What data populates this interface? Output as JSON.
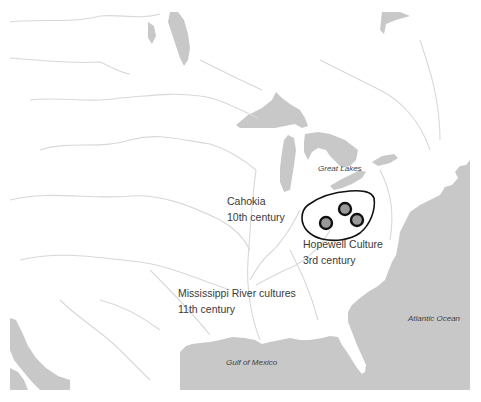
{
  "map": {
    "colors": {
      "land": "#ffffff",
      "water": "#c8c8c8",
      "river": "#d6d6d6",
      "region_outline": "#111111",
      "site_ring": "#111111",
      "site_fill": "#9a9a9a"
    },
    "water_labels": {
      "great_lakes": "Great Lakes",
      "gulf": "Gulf of Mexico",
      "atlantic": "Atlantic Ocean"
    },
    "cultures": [
      {
        "name": "Cahokia",
        "period": "10th century"
      },
      {
        "name": "Hopewell Culture",
        "period": "3rd century"
      },
      {
        "name": "Mississippi River cultures",
        "period": "11th century"
      }
    ],
    "hopewell_sites": [
      {
        "x": 345,
        "y": 209
      },
      {
        "x": 326,
        "y": 223
      },
      {
        "x": 357,
        "y": 220
      }
    ]
  }
}
